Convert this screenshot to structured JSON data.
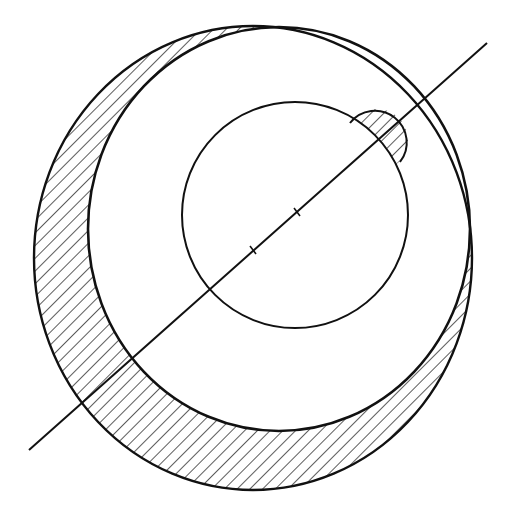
{
  "diagram": {
    "colors": {
      "stroke": "#111111",
      "background": "#ffffff",
      "hatch": "#333333"
    },
    "shapes": {
      "outer_circle": {
        "cx": 253,
        "cy": 258,
        "rx": 219,
        "ry": 232
      },
      "offset_circle": {
        "cx": 279,
        "cy": 229,
        "rx": 191,
        "ry": 202
      },
      "inner_circle": {
        "cx": 295,
        "cy": 215,
        "r": 113
      },
      "bump": {
        "cx": 377,
        "cy": 140,
        "r": 31
      },
      "axis_line": {
        "x1": 29,
        "y1": 450,
        "x2": 487,
        "y2": 43
      },
      "tick_marks": [
        {
          "x": 253,
          "y": 250
        },
        {
          "x": 297,
          "y": 212
        }
      ]
    }
  }
}
